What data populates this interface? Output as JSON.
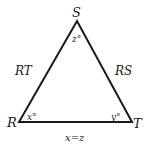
{
  "diagram": {
    "type": "triangle",
    "vertices": {
      "S": {
        "label": "S",
        "x": 77,
        "y": 21
      },
      "R": {
        "label": "R",
        "x": 19,
        "y": 122
      },
      "T": {
        "label": "T",
        "x": 132,
        "y": 122
      }
    },
    "angles": {
      "S": "z°",
      "R": "x°",
      "T": "y°"
    },
    "sides": {
      "left": "RT",
      "right": "RS",
      "bottom": "x=z"
    },
    "colors": {
      "stroke": "#1a1a1a",
      "background": "#ffffff"
    }
  }
}
